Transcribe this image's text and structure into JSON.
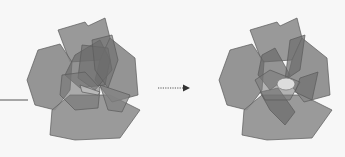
{
  "diagram": {
    "arrow": {
      "style": "dotted",
      "direction": "right"
    },
    "stages": [
      {
        "name": "before",
        "center_visible": false
      },
      {
        "name": "after",
        "center_visible": true
      }
    ]
  },
  "colors": {
    "background": "#f7f7f7",
    "petal_outer": "#8c8c8c",
    "petal_inner": "#6e6e6e",
    "outline": "#555555",
    "center": "#d9d9d9",
    "line": "#555555"
  }
}
